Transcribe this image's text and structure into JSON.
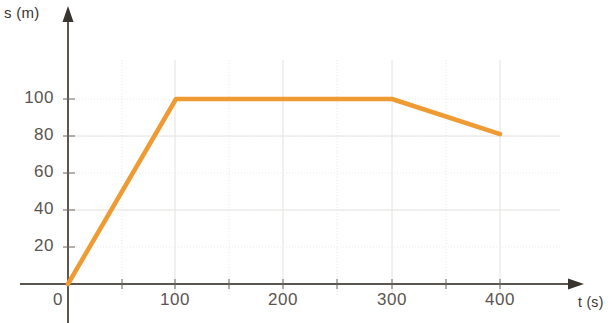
{
  "chart_data": {
    "type": "line",
    "title": "",
    "subtitle": "",
    "xlabel": "t (s)",
    "ylabel": "s (m)",
    "xlim": [
      0,
      430
    ],
    "ylim": [
      0,
      120
    ],
    "grid": true,
    "grid_minor_x_step": 50,
    "grid_minor_y_step": 20,
    "legend": "none",
    "line_color": "#f09a33",
    "axis_color": "#5c5650",
    "grid_color": "#e8e6e2",
    "x": [
      0,
      100,
      300,
      400
    ],
    "y": [
      0,
      100,
      100,
      81
    ],
    "series": [
      {
        "name": "distance",
        "x": [
          0,
          100,
          300,
          400
        ],
        "values": [
          0,
          100,
          100,
          81
        ]
      }
    ],
    "xticks": [
      0,
      100,
      200,
      300,
      400
    ],
    "xtick_labels": [
      "0",
      "100",
      "200",
      "300",
      "400"
    ],
    "yticks": [
      20,
      40,
      60,
      80,
      100
    ],
    "ytick_labels": [
      "20",
      "40",
      "60",
      "80",
      "100"
    ],
    "annotations": []
  },
  "axes": {
    "y_axis_caption": "s (m)",
    "y_axis_caption_variable": "s",
    "y_axis_caption_unit": "(m)",
    "x_axis_caption": "t (s)",
    "x_axis_caption_variable": "t",
    "x_axis_caption_unit": "(s)"
  },
  "ytick_labels": {
    "t20": "20",
    "t40": "40",
    "t60": "60",
    "t80": "80",
    "t100": "100"
  },
  "xtick_labels": {
    "t0": "0",
    "t100": "100",
    "t200": "200",
    "t300": "300",
    "t400": "400"
  }
}
